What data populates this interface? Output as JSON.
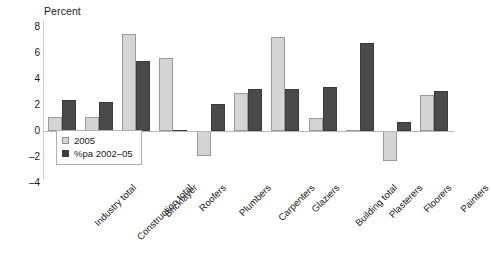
{
  "chart_data": {
    "type": "bar",
    "title": "",
    "ylabel": "Percent",
    "xlabel": "",
    "ylim": [
      -4,
      8
    ],
    "yticks": [
      -4,
      -2,
      0,
      2,
      4,
      6,
      8
    ],
    "ytick_labels": [
      "-4",
      "-2",
      "0",
      "2",
      "4",
      "6",
      "8"
    ],
    "grid": false,
    "legend_position": "inside-lower-left",
    "categories": [
      "Industry total",
      "Construction total",
      "Bricklayer",
      "Roofers",
      "Plumbers",
      "Carpenters",
      "Glaziers",
      "Building total",
      "Plasterers",
      "Floorers",
      "Painters"
    ],
    "series": [
      {
        "name": "2005",
        "color": "#d4d4d4",
        "values": [
          1.1,
          1.1,
          7.5,
          5.6,
          -1.9,
          2.9,
          7.2,
          1.0,
          0.1,
          -2.3,
          2.8
        ]
      },
      {
        "name": "%pa 2002–05",
        "color": "#4a4a4a",
        "values": [
          2.4,
          2.2,
          5.4,
          0.0,
          2.1,
          3.2,
          3.2,
          3.4,
          6.8,
          0.7,
          3.1
        ]
      }
    ]
  },
  "legend": {
    "items": [
      {
        "label": "2005"
      },
      {
        "label": "%pa 2002–05"
      }
    ]
  }
}
